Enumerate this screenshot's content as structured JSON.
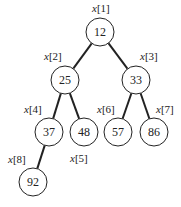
{
  "diagram": {
    "type": "binary-heap-tree",
    "nodes": [
      {
        "index": "x[1]",
        "value": "12",
        "cx": 100,
        "cy": 32,
        "lx": 92,
        "ly": 12
      },
      {
        "index": "x[2]",
        "value": "25",
        "cx": 65,
        "cy": 80,
        "lx": 44,
        "ly": 60
      },
      {
        "index": "x[3]",
        "value": "33",
        "cx": 136,
        "cy": 80,
        "lx": 140,
        "ly": 60
      },
      {
        "index": "x[4]",
        "value": "37",
        "cx": 49,
        "cy": 132,
        "lx": 24,
        "ly": 113
      },
      {
        "index": "x[5]",
        "value": "48",
        "cx": 84,
        "cy": 132,
        "lx": 70,
        "ly": 162
      },
      {
        "index": "x[6]",
        "value": "57",
        "cx": 118,
        "cy": 132,
        "lx": 97,
        "ly": 113
      },
      {
        "index": "x[7]",
        "value": "86",
        "cx": 154,
        "cy": 132,
        "lx": 156,
        "ly": 113
      },
      {
        "index": "x[8]",
        "value": "92",
        "cx": 33,
        "cy": 182,
        "lx": 8,
        "ly": 163
      }
    ],
    "edges": [
      [
        0,
        1
      ],
      [
        0,
        2
      ],
      [
        1,
        3
      ],
      [
        1,
        4
      ],
      [
        2,
        5
      ],
      [
        2,
        6
      ],
      [
        3,
        7
      ]
    ],
    "radius": 14
  }
}
